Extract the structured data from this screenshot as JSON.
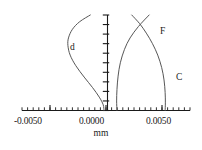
{
  "chart_data": {
    "type": "line",
    "title": "",
    "subtitle": "",
    "xlabel": "mm",
    "ylabel": "",
    "xlim": [
      -0.0075,
      0.0075
    ],
    "ylim": [
      0,
      1
    ],
    "grid": false,
    "legend_position": "inline-curve-labels",
    "xticklabels": [
      "-0.0050",
      "0.0000",
      "0.0050"
    ],
    "xtickvalues": [
      -0.005,
      0.0,
      0.005
    ],
    "minor_tick_step": 0.0005,
    "y_axis_tick_count": 10,
    "y_axis_at_x": 0.0,
    "annotations": [
      {
        "text": "d",
        "x": -0.0027,
        "y": 0.7
      },
      {
        "text": "F",
        "x": 0.004,
        "y": 0.87
      },
      {
        "text": "C",
        "x": 0.0056,
        "y": 0.42
      }
    ],
    "series": [
      {
        "name": "d",
        "label": "d",
        "color": "#4d4d4d",
        "points": [
          {
            "x": -0.0014,
            "y": 1.0
          },
          {
            "x": -0.00235,
            "y": 0.93
          },
          {
            "x": -0.003,
            "y": 0.85
          },
          {
            "x": -0.00335,
            "y": 0.76
          },
          {
            "x": -0.0034,
            "y": 0.68
          },
          {
            "x": -0.0032,
            "y": 0.58
          },
          {
            "x": -0.0027,
            "y": 0.47
          },
          {
            "x": -0.00195,
            "y": 0.35
          },
          {
            "x": -0.0012,
            "y": 0.24
          },
          {
            "x": -0.0006,
            "y": 0.14
          },
          {
            "x": -0.00025,
            "y": 0.06
          },
          {
            "x": -0.00018,
            "y": 0.0
          }
        ]
      },
      {
        "name": "F",
        "label": "F",
        "color": "#4d4d4d",
        "points": [
          {
            "x": 0.00385,
            "y": 1.0
          },
          {
            "x": 0.0029,
            "y": 0.88
          },
          {
            "x": 0.00215,
            "y": 0.76
          },
          {
            "x": 0.00165,
            "y": 0.64
          },
          {
            "x": 0.00128,
            "y": 0.5
          },
          {
            "x": 0.00108,
            "y": 0.36
          },
          {
            "x": 0.00098,
            "y": 0.22
          },
          {
            "x": 0.00095,
            "y": 0.1
          },
          {
            "x": 0.00098,
            "y": 0.0
          }
        ]
      },
      {
        "name": "C",
        "label": "C",
        "color": "#4d4d4d",
        "points": [
          {
            "x": 0.0023,
            "y": 1.0
          },
          {
            "x": 0.003,
            "y": 0.91
          },
          {
            "x": 0.0036,
            "y": 0.81
          },
          {
            "x": 0.00415,
            "y": 0.7
          },
          {
            "x": 0.00462,
            "y": 0.58
          },
          {
            "x": 0.00497,
            "y": 0.45
          },
          {
            "x": 0.00518,
            "y": 0.32
          },
          {
            "x": 0.00528,
            "y": 0.19
          },
          {
            "x": 0.0053,
            "y": 0.08
          },
          {
            "x": 0.00528,
            "y": 0.0
          }
        ]
      }
    ]
  },
  "axis": {
    "x_label_negative": "-0.0050",
    "x_label_zero": "0.0000",
    "x_label_positive": "0.0050",
    "units_label": "mm"
  },
  "curve_labels": {
    "d": "d",
    "F": "F",
    "C": "C"
  },
  "caption": {
    "partial_text": ""
  },
  "colors": {
    "curve": "#4d4d4d",
    "axis": "#1a1a1a",
    "background": "#ffffff",
    "text": "#1a1a1a"
  }
}
